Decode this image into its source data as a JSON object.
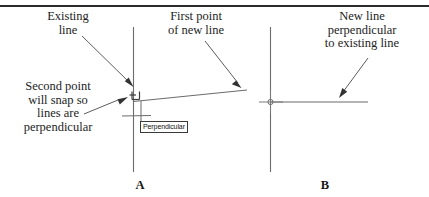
{
  "figure": {
    "stroke_color": "#6b6b6b",
    "text_color": "#1d1d1d",
    "rule_color": "#2b2b2b",
    "background": "#ffffff"
  },
  "callouts": {
    "existing_line": "Existing\nline",
    "first_point": "First point\nof new line",
    "second_point": "Second point\nwill snap so\nlines are\nperpendicular",
    "new_line": "New line\nperpendicular\nto existing line"
  },
  "tooltip": {
    "label": "Perpendicular"
  },
  "panels": [
    {
      "id": "A",
      "label": "A"
    },
    {
      "id": "B",
      "label": "B"
    }
  ],
  "markers": {
    "perpendicular_snap": "perpendicular-snap-marker",
    "node_snap": "crosshair-node-marker"
  }
}
